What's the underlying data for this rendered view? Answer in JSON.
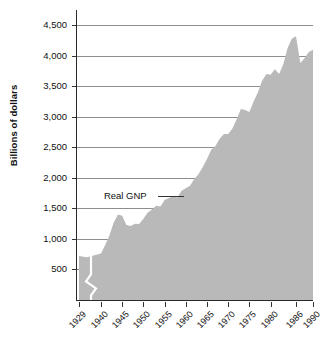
{
  "chart_data": {
    "type": "area",
    "title": "",
    "xlabel": "",
    "ylabel": "Billions of dollars",
    "series_name": "Real GNP",
    "ylim": [
      0,
      4750
    ],
    "grid": true,
    "legend_position": "inline-annotation",
    "axis_break": {
      "between": [
        "1929",
        "1940"
      ],
      "style": "zigzag",
      "color": "#ffffff"
    },
    "fill_color": "#b9b9b9",
    "gridline_color": "#8e8e8e",
    "axis_color": "#2a2a2a",
    "ytick_labels": [
      "4,500",
      "4,000",
      "3,500",
      "3,000",
      "2,500",
      "2,000",
      "1,500",
      "1,000",
      "500"
    ],
    "ytick_values": [
      4500,
      4000,
      3500,
      3000,
      2500,
      2000,
      1500,
      1000,
      500
    ],
    "xtick_labels": [
      "1929",
      "1940",
      "1945",
      "1950",
      "1955",
      "1960",
      "1965",
      "1970",
      "1975",
      "1980",
      "1986",
      "1990"
    ],
    "xtick_values": [
      1929,
      1940,
      1945,
      1950,
      1955,
      1960,
      1965,
      1970,
      1975,
      1980,
      1986,
      1990
    ],
    "annotations": [
      {
        "text": "Real GNP",
        "value": 1700,
        "year": 1952
      }
    ],
    "x": [
      1929,
      1933,
      1940,
      1941,
      1942,
      1943,
      1944,
      1945,
      1946,
      1947,
      1948,
      1949,
      1950,
      1951,
      1952,
      1953,
      1954,
      1955,
      1956,
      1957,
      1958,
      1959,
      1960,
      1961,
      1962,
      1963,
      1964,
      1965,
      1966,
      1967,
      1968,
      1969,
      1970,
      1971,
      1972,
      1973,
      1974,
      1975,
      1976,
      1977,
      1978,
      1979,
      1980,
      1981,
      1982,
      1983,
      1984,
      1985,
      1986,
      1987,
      1988,
      1989,
      1990
    ],
    "values": [
      720,
      700,
      760,
      900,
      1060,
      1270,
      1400,
      1380,
      1230,
      1210,
      1250,
      1245,
      1330,
      1430,
      1480,
      1545,
      1530,
      1640,
      1670,
      1700,
      1680,
      1790,
      1830,
      1870,
      1980,
      2060,
      2180,
      2310,
      2460,
      2520,
      2640,
      2720,
      2720,
      2810,
      2960,
      3130,
      3110,
      3080,
      3250,
      3400,
      3590,
      3700,
      3690,
      3780,
      3700,
      3860,
      4130,
      4280,
      4320,
      3880,
      3960,
      4060,
      4100
    ]
  },
  "axis_titles": {
    "y": "Billions of dollars"
  }
}
